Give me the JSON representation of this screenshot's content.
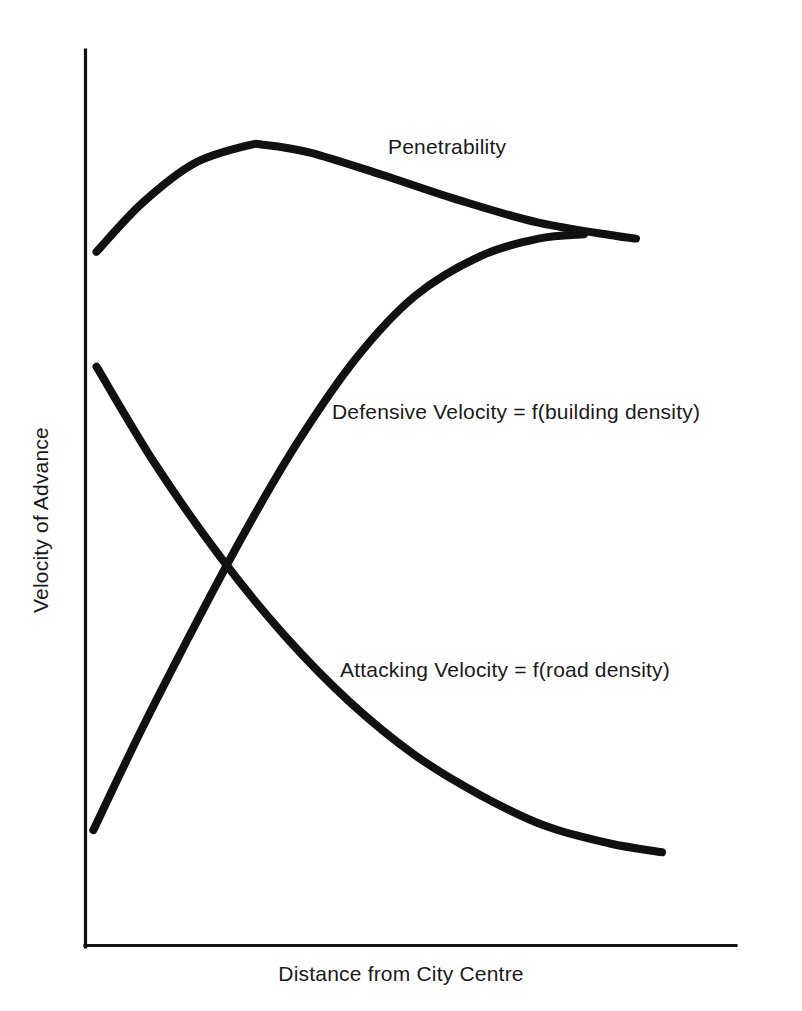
{
  "chart_data": {
    "type": "line",
    "title": "",
    "subtitle": "",
    "xlabel": "Distance from City Centre",
    "ylabel": "Velocity of Advance",
    "grid": false,
    "legend_position": "inline-annotations",
    "axes": {
      "x_axis_ticks": [],
      "y_axis_ticks": [],
      "xlim": [
        0,
        1
      ],
      "ylim": [
        0,
        1
      ],
      "note": "Schematic conceptual plot; axes are unlabelled qualitative scales with no tick marks."
    },
    "series": [
      {
        "name": "Penetrability",
        "label": "Penetrability",
        "label_position": {
          "x": 0.47,
          "y": 0.9
        },
        "x": [
          0.01,
          0.08,
          0.16,
          0.24,
          0.27,
          0.34,
          0.45,
          0.57,
          0.69,
          0.81,
          0.84
        ],
        "values": [
          0.785,
          0.84,
          0.885,
          0.905,
          0.906,
          0.897,
          0.872,
          0.843,
          0.818,
          0.803,
          0.8
        ]
      },
      {
        "name": "Defensive Velocity",
        "label": "Defensive Velocity  =  f(building density)",
        "label_position": {
          "x": 0.34,
          "y": 0.605
        },
        "x": [
          0.005,
          0.08,
          0.16,
          0.24,
          0.32,
          0.41,
          0.5,
          0.6,
          0.69,
          0.76
        ],
        "values": [
          0.13,
          0.245,
          0.36,
          0.47,
          0.57,
          0.665,
          0.735,
          0.78,
          0.8,
          0.805
        ]
      },
      {
        "name": "Attacking Velocity",
        "label": "Attacking Velocity  =  f(road density)",
        "label_position": {
          "x": 0.35,
          "y": 0.32
        },
        "x": [
          0.01,
          0.1,
          0.2,
          0.3,
          0.4,
          0.5,
          0.6,
          0.7,
          0.8,
          0.88
        ],
        "values": [
          0.655,
          0.545,
          0.44,
          0.35,
          0.275,
          0.215,
          0.17,
          0.135,
          0.115,
          0.105
        ]
      }
    ],
    "annotations": [
      {
        "text": "Penetrability"
      },
      {
        "text": "Defensive Velocity  =  f(building density)"
      },
      {
        "text": "Attacking Velocity  =  f(road density)"
      }
    ],
    "colors": {
      "curve": "#111111",
      "axis": "#111111",
      "text": "#1a1a1a",
      "background": "#ffffff"
    }
  },
  "figure": {
    "xlabel": "Distance from City Centre",
    "ylabel": "Velocity of Advance",
    "labels": {
      "penetrability": "Penetrability",
      "defensive": "Defensive Velocity  =  f(building density)",
      "attacking": "Attacking Velocity  =  f(road density)"
    }
  }
}
